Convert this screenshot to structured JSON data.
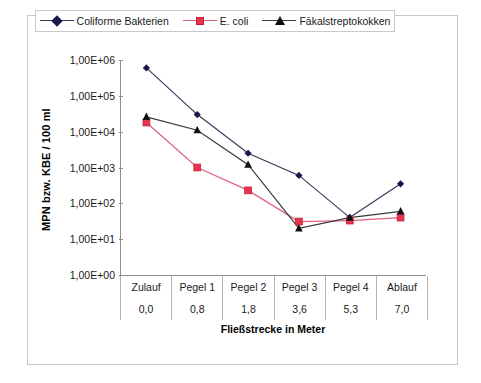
{
  "chart_data": {
    "type": "line",
    "title": "",
    "xlabel": "Fließstrecke in Meter",
    "ylabel": "MPN bzw. KBE / 100 ml",
    "yscale": "log",
    "ylim": [
      1,
      1000000
    ],
    "grid": false,
    "legend_position": "top",
    "categories": [
      "Zulauf",
      "Pegel 1",
      "Pegel 2",
      "Pegel 3",
      "Pegel 4",
      "Ablauf"
    ],
    "x_distances": [
      "0,0",
      "0,8",
      "1,8",
      "3,6",
      "5,3",
      "7,0"
    ],
    "y_ticks": [
      "1,00E+06",
      "1,00E+05",
      "1,00E+04",
      "1,00E+03",
      "1,00E+02",
      "1,00E+01",
      "1,00E+00"
    ],
    "y_tick_values": [
      1000000,
      100000,
      10000,
      1000,
      100,
      10,
      1
    ],
    "series": [
      {
        "name": "Coliforme Bakterien",
        "marker": "diamond",
        "color": "#17174a",
        "line_color": "#3a3a5c",
        "values": [
          600000,
          30000,
          2500,
          600,
          40,
          350
        ]
      },
      {
        "name": "E. coli",
        "marker": "square",
        "color": "#e8354e",
        "line_color": "#e0617a",
        "values": [
          18000,
          1000,
          230,
          31,
          33,
          40
        ]
      },
      {
        "name": "Fäkalstreptokokken",
        "marker": "triangle",
        "color": "#111111",
        "line_color": "#3a3a3a",
        "values": [
          26000,
          11000,
          1200,
          20,
          40,
          60
        ]
      }
    ]
  },
  "legend": {
    "items": [
      {
        "label": "Coliforme Bakterien"
      },
      {
        "label": "E. coli"
      },
      {
        "label": "Fäkalstreptokokken"
      }
    ]
  }
}
